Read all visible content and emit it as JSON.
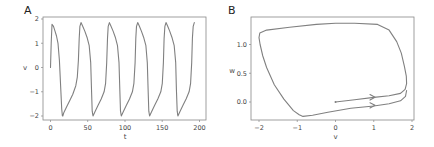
{
  "chart_data": [
    {
      "panel": "A",
      "type": "line",
      "title": "",
      "xlabel": "t",
      "ylabel": "v",
      "xlim": [
        -5,
        210
      ],
      "ylim": [
        -2.2,
        2.1
      ],
      "xticks": [
        0,
        50,
        100,
        150,
        200
      ],
      "yticks": [
        -2,
        -1,
        0,
        1,
        2
      ],
      "grid": false,
      "legend": null,
      "series": [
        {
          "name": "v(t)",
          "color": "#808080",
          "x": [
            0,
            1,
            2,
            4,
            6,
            8,
            10,
            12,
            14,
            15,
            16,
            16.5,
            18,
            22,
            26,
            30,
            34,
            36,
            37.5,
            38.5,
            39.5,
            41,
            43,
            46,
            49,
            52,
            54,
            55,
            56,
            57,
            60,
            64,
            68,
            72,
            74,
            75.5,
            76.5,
            77.5,
            79,
            81,
            84,
            87,
            90,
            92,
            93,
            94,
            95,
            98,
            102,
            106,
            110,
            112,
            113.5,
            114.5,
            115.5,
            117,
            119,
            122,
            125,
            128,
            130,
            131,
            132,
            133,
            136,
            140,
            144,
            148,
            150,
            151.5,
            152.5,
            153.5,
            155,
            157,
            160,
            163,
            166,
            168,
            169,
            170,
            171,
            174,
            178,
            182,
            186,
            188,
            189.5,
            190.5,
            191.5,
            193
          ],
          "y": [
            0,
            1.0,
            1.78,
            1.7,
            1.5,
            1.3,
            1.0,
            0.3,
            -1.0,
            -1.7,
            -2.0,
            -2.0,
            -1.85,
            -1.6,
            -1.35,
            -1.1,
            -0.75,
            -0.4,
            0.3,
            1.2,
            1.7,
            1.85,
            1.72,
            1.5,
            1.25,
            0.9,
            0.2,
            -0.9,
            -1.8,
            -2.0,
            -1.8,
            -1.55,
            -1.3,
            -1.0,
            -0.65,
            0.2,
            1.2,
            1.7,
            1.85,
            1.72,
            1.5,
            1.25,
            0.9,
            0.2,
            -0.9,
            -1.8,
            -2.0,
            -1.8,
            -1.55,
            -1.3,
            -1.0,
            -0.65,
            0.2,
            1.2,
            1.7,
            1.85,
            1.72,
            1.5,
            1.25,
            0.9,
            0.2,
            -0.9,
            -1.8,
            -2.0,
            -1.8,
            -1.55,
            -1.3,
            -1.0,
            -0.65,
            0.2,
            1.2,
            1.7,
            1.85,
            1.72,
            1.5,
            1.25,
            0.9,
            0.2,
            -0.9,
            -1.8,
            -2.0,
            -1.8,
            -1.55,
            -1.3,
            -1.0,
            -0.65,
            0.2,
            1.2,
            1.7,
            1.85
          ]
        }
      ]
    },
    {
      "panel": "B",
      "type": "line",
      "title": "",
      "xlabel": "v",
      "ylabel": "w",
      "xlim": [
        -2.2,
        2.1
      ],
      "ylim": [
        -0.32,
        1.45
      ],
      "xticks": [
        -2,
        -1,
        0,
        1,
        2
      ],
      "yticks": [
        0.0,
        0.5,
        1.0
      ],
      "grid": false,
      "legend": null,
      "annotations": [
        "start point at (0, 0)",
        "direction arrows near v=1 on two lower branches"
      ],
      "series": [
        {
          "name": "phase trajectory (v, w)",
          "color": "#808080",
          "x": [
            0,
            0.5,
            1.0,
            1.4,
            1.7,
            1.82,
            1.86,
            1.85,
            1.8,
            1.72,
            1.6,
            1.4,
            1.1,
            0.5,
            0,
            -0.5,
            -1.2,
            -1.8,
            -1.98,
            -2.0,
            -1.97,
            -1.9,
            -1.8,
            -1.6,
            -1.35,
            -1.1,
            -0.95,
            -0.85,
            -0.6,
            -0.2,
            0.4,
            1.0,
            1.4,
            1.7,
            1.83,
            1.86
          ],
          "y": [
            0.0,
            0.04,
            0.08,
            0.11,
            0.15,
            0.22,
            0.32,
            0.45,
            0.62,
            0.85,
            1.05,
            1.25,
            1.35,
            1.37,
            1.37,
            1.35,
            1.3,
            1.25,
            1.2,
            1.12,
            1.0,
            0.8,
            0.6,
            0.3,
            0.05,
            -0.15,
            -0.22,
            -0.25,
            -0.23,
            -0.18,
            -0.11,
            -0.07,
            -0.03,
            0.02,
            0.1,
            0.2
          ]
        }
      ]
    }
  ],
  "panels": {
    "a": {
      "label": "A",
      "xlabel": "t",
      "ylabel": "v",
      "xticks": [
        "0",
        "50",
        "100",
        "150",
        "200"
      ],
      "yticks": [
        "2",
        "1",
        "0",
        "−1",
        "−2"
      ]
    },
    "b": {
      "label": "B",
      "xlabel": "v",
      "ylabel": "w",
      "xticks": [
        "−2",
        "−1",
        "0",
        "1",
        "2"
      ],
      "yticks": [
        "1.0",
        "0.5",
        "0.0"
      ]
    }
  },
  "colors": {
    "line": "#808080",
    "frame": "#888888",
    "text": "#444444"
  }
}
